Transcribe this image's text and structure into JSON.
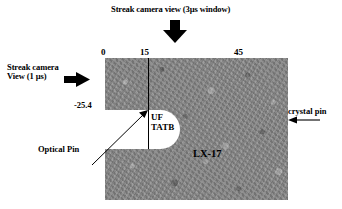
{
  "figure": {
    "title": "Streak camera view (3µs window)",
    "left_view_line1": "Streak camera",
    "left_view_line2": "View (1 µs)",
    "axis_ticks": [
      "0",
      "15",
      "45"
    ],
    "depth_label": "-25.4",
    "uf_tatb_line1": "UF",
    "uf_tatb_line2": "TATB",
    "sample_label": "LX-17",
    "optical_pin_label": "Optical Pin",
    "crystal_pin_label": "crystal pin",
    "colors": {
      "sample_gray": "#8a8a8a",
      "notch_white": "#ffffff",
      "ink": "#000000",
      "background": "#ffffff"
    },
    "icons": {
      "top_arrow": "arrow-down-icon",
      "left_arrow": "arrow-right-icon",
      "right_arrow": "arrow-left-icon",
      "optical_pin_leader": "leader-line-arrow-icon"
    }
  }
}
